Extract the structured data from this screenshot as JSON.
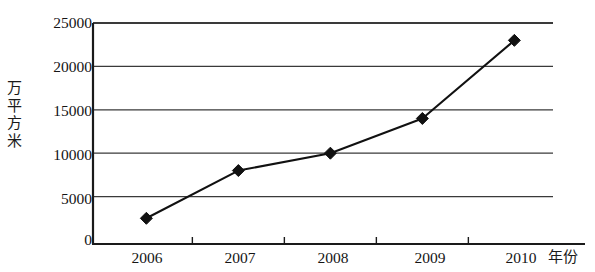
{
  "chart_data": {
    "type": "line",
    "title": "",
    "subtitle": "",
    "xlabel": "年份",
    "ylabel": "万平方米",
    "categories": [
      "2006",
      "2007",
      "2008",
      "2009",
      "2010"
    ],
    "values": [
      2500,
      8000,
      10000,
      14000,
      23000
    ],
    "series": [
      {
        "name": "",
        "values": [
          2500,
          8000,
          10000,
          14000,
          23000
        ]
      }
    ],
    "ylim": [
      0,
      25000
    ],
    "ytick_labels": [
      "0",
      "5000",
      "10000",
      "15000",
      "20000",
      "25000"
    ],
    "ytick_values": [
      0,
      5000,
      10000,
      15000,
      20000,
      25000
    ],
    "xtick_labels": [
      "2006",
      "2007",
      "2008",
      "2009",
      "2010"
    ],
    "grid": "horizontal",
    "legend": "none",
    "marker": "diamond",
    "line_color": "#111111",
    "marker_color": "#111111",
    "axis_color": "#1a1a1a",
    "grid_color": "#3a3a3a",
    "background_color": "#ffffff",
    "annotations": []
  },
  "axis": {
    "y_title_chars": [
      "万",
      "平",
      "方",
      "米"
    ],
    "x_title": "年份"
  }
}
